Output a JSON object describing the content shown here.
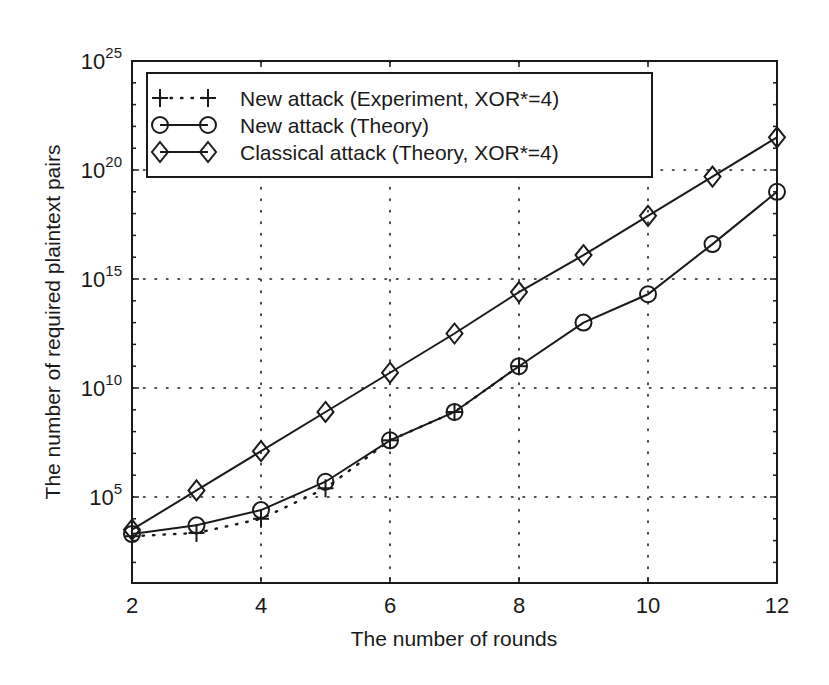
{
  "chart_data": {
    "type": "line",
    "title": "",
    "xlabel": "The number of rounds",
    "ylabel": "The number of required plaintext pairs",
    "x_ticks": [
      2,
      4,
      6,
      8,
      10,
      12
    ],
    "y_ticks": [
      {
        "base": "10",
        "exp": "5",
        "log": 5
      },
      {
        "base": "10",
        "exp": "10",
        "log": 10
      },
      {
        "base": "10",
        "exp": "15",
        "log": 15
      },
      {
        "base": "10",
        "exp": "20",
        "log": 20
      },
      {
        "base": "10",
        "exp": "25",
        "log": 25
      }
    ],
    "xlim": [
      2,
      12
    ],
    "ylim_log10": [
      1.1,
      25
    ],
    "yscale": "log",
    "grid": true,
    "legend_position": "upper left",
    "series": [
      {
        "name": "New attack (Experiment, XOR*=4)",
        "marker": "plus",
        "linestyle": "dotted",
        "x": [
          2,
          3,
          4,
          5,
          6,
          7,
          8
        ],
        "log10_values": [
          3.2,
          3.35,
          4.0,
          5.4,
          7.6,
          8.9,
          11.0
        ]
      },
      {
        "name": "New attack (Theory)",
        "marker": "circle",
        "linestyle": "solid",
        "x": [
          2,
          3,
          4,
          5,
          6,
          7,
          8,
          9,
          10,
          11,
          12
        ],
        "log10_values": [
          3.3,
          3.7,
          4.4,
          5.7,
          7.6,
          8.9,
          11.0,
          13.0,
          14.3,
          16.6,
          19.0
        ]
      },
      {
        "name": "Classical attack (Theory, XOR*=4)",
        "marker": "diamond",
        "linestyle": "solid",
        "x": [
          2,
          3,
          4,
          5,
          6,
          7,
          8,
          9,
          10,
          11,
          12
        ],
        "log10_values": [
          3.5,
          5.3,
          7.1,
          8.9,
          10.7,
          12.5,
          14.4,
          16.1,
          17.9,
          19.7,
          21.5
        ]
      }
    ]
  },
  "colors": {
    "ink": "#1a1a1a",
    "background": "#ffffff"
  }
}
